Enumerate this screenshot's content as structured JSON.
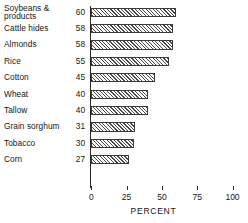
{
  "chart_data": {
    "type": "bar",
    "orientation": "horizontal",
    "title": "",
    "xlabel": "PERCENT",
    "ylabel": "",
    "xlim": [
      0,
      100
    ],
    "xticks": [
      0,
      25,
      50,
      75,
      100
    ],
    "xtick_labels": [
      "0",
      "25",
      "50",
      "75",
      "100"
    ],
    "grid": false,
    "legend": null,
    "categories": [
      "Soybeans &\nproducts",
      "Cattle hides",
      "Almonds",
      "Rice",
      "Cotton",
      "Wheat",
      "Tallow",
      "Grain sorghum",
      "Tobacco",
      "Corn"
    ],
    "values": [
      60,
      58,
      58,
      55,
      45,
      40,
      40,
      31,
      30,
      27
    ],
    "value_labels": [
      "60",
      "58",
      "58",
      "55",
      "45",
      "40",
      "40",
      "31",
      "30",
      "27"
    ],
    "bar_style": {
      "fill": "diagonal-hatch",
      "hatch_color": "#4a4a4a",
      "background": "#fdfdfd",
      "border_color": "#3a3a3a"
    },
    "axis_color": "#2a2a2a"
  }
}
